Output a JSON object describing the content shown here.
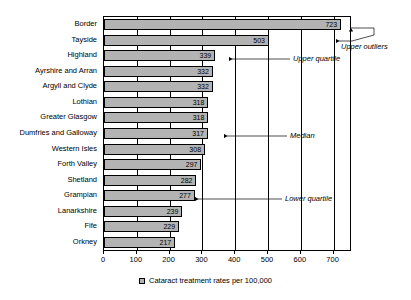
{
  "chart_data": {
    "type": "bar",
    "orientation": "horizontal",
    "title": "",
    "xlabel": "",
    "ylabel": "",
    "xlim": [
      0,
      750
    ],
    "xticks": [
      0,
      100,
      200,
      300,
      400,
      500,
      600,
      700
    ],
    "grid": true,
    "legend_position": "bottom",
    "legend": [
      "Cataract treatment rates per 100,000"
    ],
    "categories": [
      "Border",
      "Tayside",
      "Highland",
      "Ayrshire and Arran",
      "Argyll and Clyde",
      "Lothian",
      "Greater Glasgow",
      "Dumfries and Galloway",
      "Western Isles",
      "Forth Valley",
      "Shetland",
      "Grampian",
      "Lanarkshire",
      "Fife",
      "Orkney"
    ],
    "values": [
      723,
      503,
      339,
      332,
      332,
      318,
      318,
      317,
      308,
      297,
      282,
      277,
      239,
      229,
      217
    ],
    "annotations": [
      {
        "label": "Upper outliers",
        "target_category": "Tayside"
      },
      {
        "label": "Upper quartile",
        "target_category": "Ayrshire and Arran"
      },
      {
        "label": "Median",
        "target_category": "Dumfries and Galloway"
      },
      {
        "label": "Lower quartile",
        "target_category": "Grampian"
      }
    ]
  },
  "legend": {
    "series_label": "Cataract treatment rates per 100,000"
  },
  "annotations": {
    "upper_outliers": "Upper outliers",
    "upper_quartile": "Upper quartile",
    "median": "Median",
    "lower_quartile": "Lower quartile"
  },
  "colors": {
    "bar_fill": "#b3b3b3",
    "bar_stroke": "#000000",
    "axis": "#000000",
    "background": "#ffffff"
  }
}
